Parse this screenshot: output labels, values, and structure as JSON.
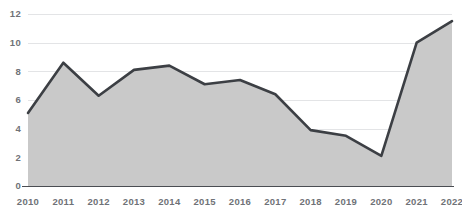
{
  "chart_data": {
    "type": "area",
    "title": "",
    "subtitle": "",
    "xlabel": "",
    "ylabel": "",
    "categories": [
      "2010",
      "2011",
      "2012",
      "2013",
      "2014",
      "2015",
      "2016",
      "2017",
      "2018",
      "2019",
      "2020",
      "2021",
      "2022"
    ],
    "values": [
      5.1,
      8.6,
      6.3,
      8.1,
      8.4,
      7.1,
      7.4,
      6.4,
      3.9,
      3.5,
      2.1,
      10.0,
      11.5
    ],
    "series": [
      {
        "name": "",
        "values": [
          5.1,
          8.6,
          6.3,
          8.1,
          8.4,
          7.1,
          7.4,
          6.4,
          3.9,
          3.5,
          2.1,
          10.0,
          11.5
        ]
      }
    ],
    "ylim": [
      0,
      12
    ],
    "yticks": [
      0,
      2,
      4,
      6,
      8,
      10,
      12
    ],
    "ytick_labels": [
      "0",
      "2",
      "4",
      "6",
      "8",
      "10",
      "12"
    ],
    "xtick_labels": [
      "2010",
      "2011",
      "2012",
      "2013",
      "2014",
      "2015",
      "2016",
      "2017",
      "2018",
      "2019",
      "2020",
      "2021",
      "2022"
    ],
    "grid": true,
    "grid_axis": "y",
    "legend": false,
    "legend_position": "none",
    "annotations": [],
    "colors": {
      "line": "#3c3f44",
      "fill": "#c9c9c9",
      "gridline": "#e3e4e6",
      "axis": "#4a4d52",
      "tick_label": "#6f7277",
      "background": "#ffffff"
    }
  }
}
